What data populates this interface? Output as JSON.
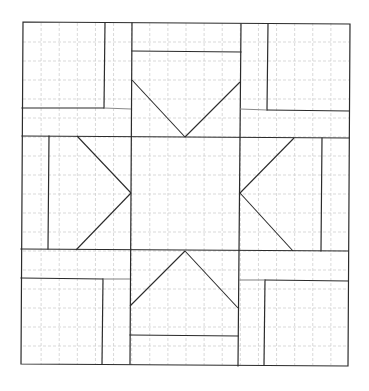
{
  "diagram": {
    "type": "quilt-block-pattern",
    "grid": {
      "divisions": 18,
      "style": "dashed"
    },
    "colors": {
      "line": "#2b2b2b",
      "grid": "#cfcfcf",
      "background": "#ffffff"
    },
    "regions": [
      {
        "name": "center-square"
      },
      {
        "name": "star-point-top"
      },
      {
        "name": "star-point-bottom"
      },
      {
        "name": "star-point-left"
      },
      {
        "name": "star-point-right"
      },
      {
        "name": "corner-top-left"
      },
      {
        "name": "corner-top-right"
      },
      {
        "name": "corner-bottom-left"
      },
      {
        "name": "corner-bottom-right"
      }
    ]
  }
}
